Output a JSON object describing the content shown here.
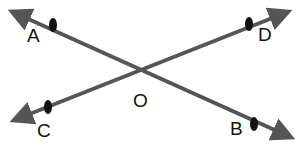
{
  "diagram": {
    "line_color": "#555555",
    "point_color": "#111111",
    "points": [
      {
        "label": "A",
        "x": 53,
        "y": 25,
        "lx": 27,
        "ly": 26
      },
      {
        "label": "D",
        "x": 249,
        "y": 24,
        "lx": 258,
        "ly": 25
      },
      {
        "label": "C",
        "x": 48,
        "y": 107,
        "lx": 37,
        "ly": 121
      },
      {
        "label": "B",
        "x": 254,
        "y": 124,
        "lx": 230,
        "ly": 119
      },
      {
        "label": "O",
        "x": 135,
        "y": 68,
        "lx": 133,
        "ly": 91
      }
    ],
    "lines": [
      {
        "name": "line-AB",
        "x1": 15,
        "y1": 13,
        "x2": 288,
        "y2": 136
      },
      {
        "name": "line-CD",
        "x1": 17,
        "y1": 119,
        "x2": 285,
        "y2": 13
      }
    ]
  }
}
